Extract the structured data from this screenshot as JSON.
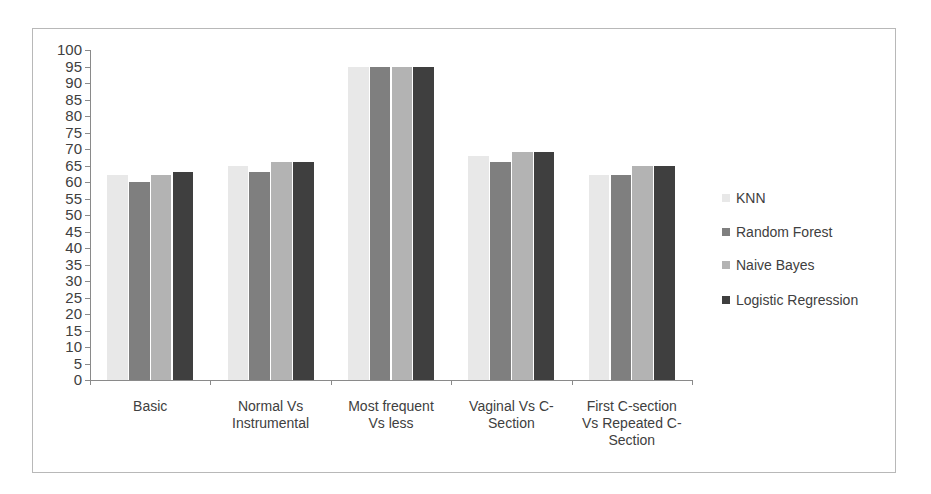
{
  "chart_data": {
    "type": "bar",
    "title": "",
    "xlabel": "",
    "ylabel": "",
    "ylim": [
      0,
      100
    ],
    "yticks": [
      0,
      5,
      10,
      15,
      20,
      25,
      30,
      35,
      40,
      45,
      50,
      55,
      60,
      65,
      70,
      75,
      80,
      85,
      90,
      95,
      100
    ],
    "categories": [
      "Basic",
      "Normal Vs Instrumental",
      "Most frequent Vs less",
      "Vaginal Vs C-Section",
      "First C-section Vs Repeated C-Section"
    ],
    "category_lines": [
      [
        "Basic"
      ],
      [
        "Normal Vs",
        "Instrumental"
      ],
      [
        "Most frequent",
        "Vs less"
      ],
      [
        "Vaginal Vs C-",
        "Section"
      ],
      [
        "First C-section",
        "Vs Repeated C-",
        "Section"
      ]
    ],
    "series": [
      {
        "name": "KNN",
        "color": "#e8e8e8",
        "values": [
          62,
          65,
          95,
          68,
          62
        ]
      },
      {
        "name": "Random Forest",
        "color": "#7f7f7f",
        "values": [
          60,
          63,
          95,
          66,
          62
        ]
      },
      {
        "name": "Naive Bayes",
        "color": "#b3b3b3",
        "values": [
          62,
          66,
          95,
          69,
          65
        ]
      },
      {
        "name": "Logistic Regression",
        "color": "#3f3f3f",
        "values": [
          63,
          66,
          95,
          69,
          65
        ]
      }
    ],
    "legend_position": "right",
    "grid": false
  },
  "legend": {
    "items": [
      {
        "label": "KNN",
        "color": "#e8e8e8"
      },
      {
        "label": "Random Forest",
        "color": "#7f7f7f"
      },
      {
        "label": "Naive Bayes",
        "color": "#b3b3b3"
      },
      {
        "label": "Logistic Regression",
        "color": "#3f3f3f"
      }
    ]
  }
}
